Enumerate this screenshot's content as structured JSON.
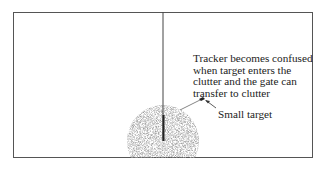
{
  "diagram": {
    "caption_lines": [
      "Tracker becomes confused",
      "when target enters the",
      "clutter and the gate can",
      "transfer to clutter"
    ],
    "small_target_label": "Small target",
    "colors": {
      "frame": "#555555",
      "track_line": "#333333",
      "clutter": "#9a9a9a",
      "text": "#222222"
    }
  }
}
